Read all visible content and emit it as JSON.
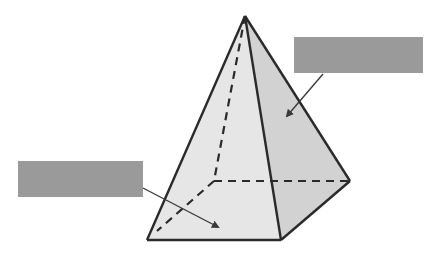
{
  "diagram": {
    "colors": {
      "background": "#ffffff",
      "front_face": "#e6e6e6",
      "right_face": "#d2d2d2",
      "edge": "#2a2a2a",
      "label_box": "#9a9a9a",
      "arrow": "#3a3a3a"
    },
    "vertices": {
      "apex": [
        245,
        16
      ],
      "front_left": [
        147,
        240
      ],
      "front_right": [
        281,
        240
      ],
      "back_right": [
        350,
        181
      ],
      "back_left_hidden": [
        214,
        181
      ]
    },
    "labels": [
      {
        "id": "right-face-label",
        "text": "",
        "box": [
          294,
          37,
          129,
          36
        ],
        "arrow_from": [
          323,
          74
        ],
        "arrow_to": [
          285,
          118
        ]
      },
      {
        "id": "front-face-label",
        "text": "",
        "box": [
          18,
          161,
          125,
          36
        ],
        "arrow_from": [
          143,
          188
        ],
        "arrow_to": [
          220,
          228
        ]
      }
    ]
  }
}
